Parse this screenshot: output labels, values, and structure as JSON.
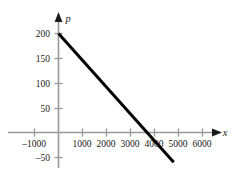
{
  "chart_data": {
    "type": "line",
    "title": "",
    "subtitle": "",
    "xlabel": "x",
    "ylabel": "p",
    "xlim": [
      -1700,
      6900
    ],
    "ylim": [
      -85,
      235
    ],
    "grid": false,
    "legend": null,
    "series": [
      {
        "name": "price-demand line",
        "points": [
          {
            "x": 0,
            "y": 200
          },
          {
            "x": 4800,
            "y": -60
          }
        ],
        "color": "#000000",
        "x_intercept": 4000,
        "y_intercept": 200,
        "slope": -0.05
      }
    ],
    "x_ticks": [
      {
        "value": -1000,
        "label": "–1000"
      },
      {
        "value": 1000,
        "label": "1000"
      },
      {
        "value": 2000,
        "label": "2000"
      },
      {
        "value": 3000,
        "label": "3000"
      },
      {
        "value": 4000,
        "label": "4000"
      },
      {
        "value": 5000,
        "label": "5000"
      },
      {
        "value": 6000,
        "label": "6000"
      }
    ],
    "y_ticks": [
      {
        "value": 200,
        "label": "200"
      },
      {
        "value": 150,
        "label": "150"
      },
      {
        "value": 100,
        "label": "100"
      },
      {
        "value": 50,
        "label": "50"
      },
      {
        "value": -50,
        "label": "–50"
      }
    ]
  },
  "axes": {
    "x_axis_name": "x",
    "y_axis_name": "p",
    "axis_color": "#9a9a9a",
    "arrow_color": "#1a1a1a",
    "line_color": "#000000",
    "background": "#ffffff"
  },
  "labels": {
    "x": {
      "neg1000": "–1000",
      "t1000": "1000",
      "t2000": "2000",
      "t3000": "3000",
      "t4000": "4000",
      "t5000": "5000",
      "t6000": "6000"
    },
    "y": {
      "t200": "200",
      "t150": "150",
      "t100": "100",
      "t50": "50",
      "neg50": "–50"
    }
  }
}
